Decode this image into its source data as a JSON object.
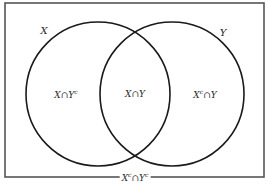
{
  "diagram": {
    "type": "venn",
    "universe": {
      "x": 5,
      "y": 3,
      "width": 259,
      "height": 174,
      "stroke": "#555555",
      "label_parts": [
        "X",
        "c",
        "∩Y",
        "c"
      ],
      "label_x": 135,
      "label_y": 177
    },
    "sets": [
      {
        "name": "X",
        "cx": 98,
        "cy": 94,
        "r": 72,
        "stroke": "#1a1a1a",
        "label": "X",
        "label_x": 44,
        "label_y": 31
      },
      {
        "name": "Y",
        "cx": 172,
        "cy": 94,
        "r": 72,
        "stroke": "#1a1a1a",
        "label": "Y",
        "label_x": 223,
        "label_y": 33
      }
    ],
    "regions": [
      {
        "id": "x-only",
        "parts": [
          "X∩Y",
          "c",
          "",
          ""
        ],
        "x": 66,
        "y": 94
      },
      {
        "id": "intersection",
        "parts": [
          "X∩Y",
          "",
          "",
          ""
        ],
        "x": 135,
        "y": 94
      },
      {
        "id": "y-only",
        "parts": [
          "X",
          "c",
          "∩Y",
          ""
        ],
        "x": 205,
        "y": 94
      }
    ]
  }
}
